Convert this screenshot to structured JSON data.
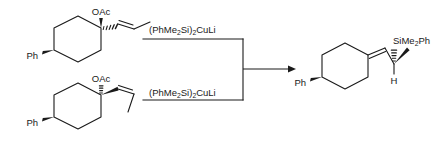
{
  "scheme": {
    "title": "Silylcupration of allylic acetates",
    "background_color": "#ffffff",
    "line_color": "#1a1a1a",
    "canvas": {
      "width": 439,
      "height": 142
    }
  },
  "reactants": [
    {
      "id": "reactant-top",
      "alkene_geometry": "E",
      "labels": {
        "acetoxy": "OAc",
        "phenyl": "Ph"
      },
      "stereo": {
        "acetoxy_bond": "wedge",
        "alkenyl_bond": "hash",
        "phenyl_bond": "wedge"
      }
    },
    {
      "id": "reactant-bottom",
      "alkene_geometry": "Z",
      "labels": {
        "acetoxy": "OAc",
        "phenyl": "Ph"
      },
      "stereo": {
        "acetoxy_bond": "hash",
        "alkenyl_bond": "wedge",
        "phenyl_bond": "wedge"
      }
    }
  ],
  "reagents": [
    {
      "id": "reagent-top",
      "formula_parts": [
        "(PhMe",
        "2",
        "Si)",
        "2",
        "CuLi"
      ],
      "formula_text": "(PhMe2Si)2CuLi"
    },
    {
      "id": "reagent-bottom",
      "formula_parts": [
        "(PhMe",
        "2",
        "Si)",
        "2",
        "CuLi"
      ],
      "formula_text": "(PhMe2Si)2CuLi"
    }
  ],
  "arrow": {
    "direction": "right",
    "style": "single-headed"
  },
  "product": {
    "id": "product",
    "labels": {
      "silyl_parts": [
        "SiMe",
        "2",
        "Ph"
      ],
      "silyl_text": "SiMe2Ph",
      "hydrogen": "H",
      "phenyl": "Ph"
    },
    "stereo": {
      "silyl_bond": "hash",
      "methyl_bond": "plain",
      "phenyl_bond": "wedge"
    },
    "alkene": "exocyclic alkylidene"
  }
}
